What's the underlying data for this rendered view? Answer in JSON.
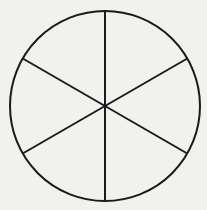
{
  "figure": {
    "name": "fraction-circle",
    "type": "pie-circle-diagram",
    "background_color": "#f1f1ef",
    "stroke_color": "#1b1b1b",
    "stroke_width": 2,
    "canvas": {
      "width": 207,
      "height": 210
    },
    "circle": {
      "center_x": 105,
      "center_y": 106,
      "radius": 95
    },
    "sector_count": 6,
    "sector_angle_degrees": 60,
    "fraction_label": "1/6",
    "diameters": [
      {
        "name": "vertical-diameter",
        "angle_degrees": 90,
        "x1": 105,
        "y1": 11,
        "x2": 105,
        "y2": 201
      },
      {
        "name": "diagonal-diameter-ne-sw",
        "angle_degrees": 30,
        "x1": 187.27,
        "y1": 58.5,
        "x2": 22.73,
        "y2": 153.5
      },
      {
        "name": "diagonal-diameter-nw-se",
        "angle_degrees": 150,
        "x1": 22.73,
        "y1": 58.5,
        "x2": 187.27,
        "y2": 153.5
      }
    ],
    "sectors": [
      {
        "name": "sector-top-right",
        "start_angle": 30,
        "end_angle": 90
      },
      {
        "name": "sector-right",
        "start_angle": -30,
        "end_angle": 30
      },
      {
        "name": "sector-bottom-right",
        "start_angle": -90,
        "end_angle": -30
      },
      {
        "name": "sector-bottom-left",
        "start_angle": 210,
        "end_angle": 270
      },
      {
        "name": "sector-left",
        "start_angle": 150,
        "end_angle": 210
      },
      {
        "name": "sector-top-left",
        "start_angle": 90,
        "end_angle": 150
      }
    ]
  }
}
